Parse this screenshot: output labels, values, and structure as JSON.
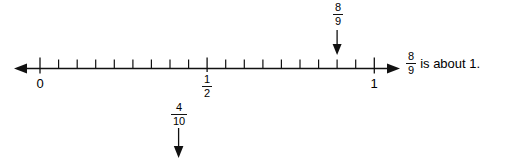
{
  "figure": {
    "type": "number-line",
    "axis": {
      "start_value": 0,
      "end_value": 1,
      "divisions": 18,
      "left_arrow": true,
      "right_arrow": true,
      "labeled_ticks": [
        {
          "value": "0",
          "label": "0",
          "position": 0
        },
        {
          "value": "1/2",
          "numerator": "1",
          "denominator": "2",
          "position": 0.5
        },
        {
          "value": "1",
          "label": "1",
          "position": 1
        }
      ]
    },
    "annotations": [
      {
        "id": "top-arrow",
        "numerator": "8",
        "denominator": "9",
        "position": 0.8889,
        "direction": "down",
        "side": "above-line"
      },
      {
        "id": "bottom-arrow",
        "numerator": "4",
        "denominator": "10",
        "position": 0.4,
        "direction": "down",
        "side": "below-line"
      }
    ],
    "statement": {
      "numerator": "8",
      "denominator": "9",
      "text": "is about 1."
    },
    "colors": {
      "ink": "#111111",
      "background": "#ffffff"
    }
  }
}
